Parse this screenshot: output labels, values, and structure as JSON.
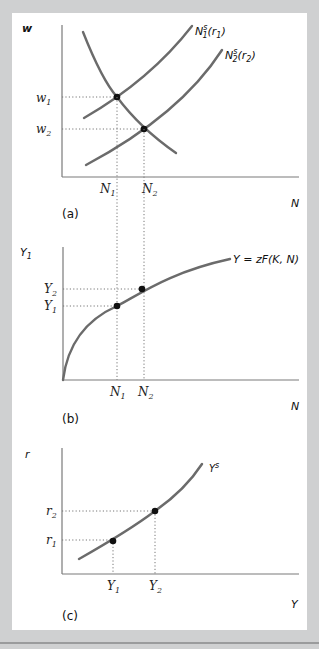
{
  "figure": {
    "panels": [
      {
        "id": "a",
        "tag": "(a)",
        "y_axis_label": "w",
        "x_axis_label": "N",
        "curves": [
          {
            "name": "labor-demand",
            "label": ""
          },
          {
            "name": "labor-supply-1",
            "label_main": "N",
            "label_sub": "1",
            "label_sup": "s",
            "label_arg": "(r",
            "label_arg_sub": "1",
            "label_close": ")"
          },
          {
            "name": "labor-supply-2",
            "label_main": "N",
            "label_sub": "2",
            "label_sup": "s",
            "label_arg": "(r",
            "label_arg_sub": "2",
            "label_close": ")"
          }
        ],
        "y_ticks": [
          {
            "main": "w",
            "sub": "1"
          },
          {
            "main": "w",
            "sub": "2"
          }
        ],
        "x_ticks": [
          {
            "main": "N",
            "sub": "1"
          },
          {
            "main": "N",
            "sub": "2"
          }
        ]
      },
      {
        "id": "b",
        "tag": "(b)",
        "y_axis_label_main": "Y",
        "y_axis_label_sub": "1",
        "x_axis_label": "N",
        "curve_label": "Y = zF(K, N)",
        "y_ticks": [
          {
            "main": "Y",
            "sub": "2"
          },
          {
            "main": "Y",
            "sub": "1"
          }
        ],
        "x_ticks": [
          {
            "main": "N",
            "sub": "1"
          },
          {
            "main": "N",
            "sub": "2"
          }
        ]
      },
      {
        "id": "c",
        "tag": "(c)",
        "y_axis_label": "r",
        "x_axis_label": "Y",
        "curve_label_main": "Y",
        "curve_label_sup": "s",
        "y_ticks": [
          {
            "main": "r",
            "sub": "2"
          },
          {
            "main": "r",
            "sub": "1"
          }
        ],
        "x_ticks": [
          {
            "main": "Y",
            "sub": "1"
          },
          {
            "main": "Y",
            "sub": "2"
          }
        ]
      }
    ]
  }
}
